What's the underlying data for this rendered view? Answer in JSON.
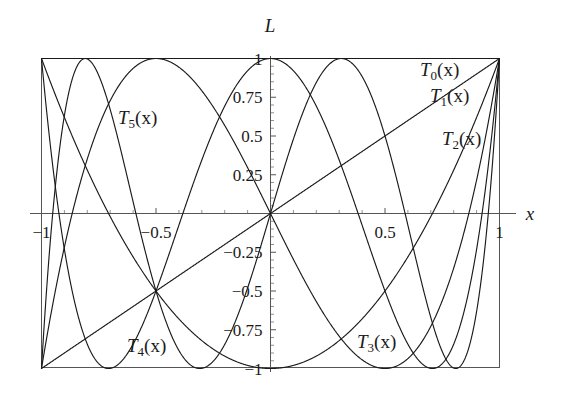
{
  "figure": {
    "title": "",
    "y_axis_name": "L",
    "x_axis_name": "x",
    "background_color": "#ffffff",
    "curve_color": "#1a1a1a",
    "axis_color": "#555555"
  },
  "axes": {
    "x_ticks": [
      {
        "value": -1,
        "label": "-1"
      },
      {
        "value": -0.5,
        "label": "-0.5"
      },
      {
        "value": 0.5,
        "label": "0.5"
      },
      {
        "value": 1,
        "label": "1"
      }
    ],
    "y_ticks": [
      {
        "value": 1,
        "label": "1"
      },
      {
        "value": 0.75,
        "label": "0.75"
      },
      {
        "value": 0.5,
        "label": "0.5"
      },
      {
        "value": 0.25,
        "label": "0.25"
      },
      {
        "value": -0.25,
        "label": "-0.25"
      },
      {
        "value": -0.5,
        "label": "-0.5"
      },
      {
        "value": -0.75,
        "label": "-0.75"
      },
      {
        "value": -1,
        "label": "-1"
      }
    ],
    "x_minor_step": 0.1,
    "y_minor_step": 0.05
  },
  "labels": {
    "t0": {
      "base": "T",
      "sub": "0",
      "arg": "(x)",
      "x": 420,
      "y": 76
    },
    "t1": {
      "base": "T",
      "sub": "1",
      "arg": "(x)",
      "x": 430,
      "y": 102
    },
    "t2": {
      "base": "T",
      "sub": "2",
      "arg": "(x)",
      "x": 442,
      "y": 145
    },
    "t3": {
      "base": "T",
      "sub": "3",
      "arg": "(x)",
      "x": 357,
      "y": 348
    },
    "t4": {
      "base": "T",
      "sub": "4",
      "arg": "(x)",
      "x": 127,
      "y": 352
    },
    "t5": {
      "base": "T",
      "sub": "5",
      "arg": "(x)",
      "x": 118,
      "y": 124
    }
  },
  "chart_data": {
    "type": "line",
    "title": "",
    "xlabel": "x",
    "ylabel": "L",
    "xlim": [
      -1,
      1
    ],
    "ylim": [
      -1,
      1
    ],
    "grid": false,
    "legend_position": "inline-annotations",
    "xticks": [
      -1,
      -0.5,
      0.5,
      1
    ],
    "xticklabels": [
      "-1",
      "-0.5",
      "0.5",
      "1"
    ],
    "yticks": [
      1,
      0.75,
      0.5,
      0.25,
      -0.25,
      -0.5,
      -0.75,
      -1
    ],
    "yticklabels": [
      "1",
      "0.75",
      "0.5",
      "0.25",
      "-0.25",
      "-0.5",
      "-0.75",
      "-1"
    ],
    "series": [
      {
        "name": "T0(x)",
        "formula": "1",
        "degree": 0,
        "annotation": "T0(x)",
        "x": [
          -1,
          -0.8,
          -0.6,
          -0.4,
          -0.2,
          0,
          0.2,
          0.4,
          0.6,
          0.8,
          1
        ],
        "values": [
          1,
          1,
          1,
          1,
          1,
          1,
          1,
          1,
          1,
          1,
          1
        ]
      },
      {
        "name": "T1(x)",
        "formula": "x",
        "degree": 1,
        "annotation": "T1(x)",
        "x": [
          -1,
          -0.8,
          -0.6,
          -0.4,
          -0.2,
          0,
          0.2,
          0.4,
          0.6,
          0.8,
          1
        ],
        "values": [
          -1,
          -0.8,
          -0.6,
          -0.4,
          -0.2,
          0,
          0.2,
          0.4,
          0.6,
          0.8,
          1
        ]
      },
      {
        "name": "T2(x)",
        "formula": "2x^2 - 1",
        "degree": 2,
        "annotation": "T2(x)",
        "x": [
          -1,
          -0.8,
          -0.6,
          -0.4,
          -0.2,
          0,
          0.2,
          0.4,
          0.6,
          0.8,
          1
        ],
        "values": [
          1,
          0.28,
          -0.28,
          -0.68,
          -0.92,
          -1,
          -0.92,
          -0.68,
          -0.28,
          0.28,
          1
        ]
      },
      {
        "name": "T3(x)",
        "formula": "4x^3 - 3x",
        "degree": 3,
        "annotation": "T3(x)",
        "x": [
          -1,
          -0.8,
          -0.6,
          -0.4,
          -0.2,
          0,
          0.2,
          0.4,
          0.6,
          0.8,
          1
        ],
        "values": [
          -1,
          0.352,
          0.936,
          0.944,
          0.568,
          0,
          -0.568,
          -0.944,
          -0.936,
          -0.352,
          1
        ]
      },
      {
        "name": "T4(x)",
        "formula": "8x^4 - 8x^2 + 1",
        "degree": 4,
        "annotation": "T4(x)",
        "x": [
          -1,
          -0.8,
          -0.6,
          -0.4,
          -0.2,
          0,
          0.2,
          0.4,
          0.6,
          0.8,
          1
        ],
        "values": [
          1,
          -0.8432,
          -0.8432,
          0.0848,
          0.6848,
          1,
          0.6848,
          0.0848,
          -0.8432,
          -0.8432,
          1
        ]
      },
      {
        "name": "T5(x)",
        "formula": "16x^5 - 20x^3 + 5x",
        "degree": 5,
        "annotation": "T5(x)",
        "x": [
          -1,
          -0.8,
          -0.6,
          -0.4,
          -0.2,
          0,
          0.2,
          0.4,
          0.6,
          0.8,
          1
        ],
        "values": [
          -1,
          0.99328,
          -0.20256,
          -0.99712,
          -0.64752,
          0,
          0.64752,
          0.99712,
          0.20256,
          -0.99328,
          1
        ]
      }
    ]
  }
}
